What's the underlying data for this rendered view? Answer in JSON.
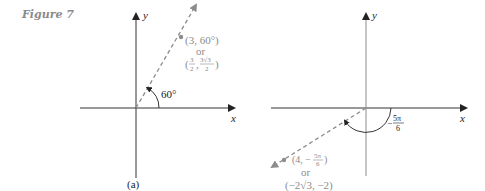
{
  "figure": {
    "title": "Figure 7",
    "colors": {
      "axis": "#333333",
      "dashed": "#8c8c8c",
      "gray_text": "#8c8c8c",
      "text": "#222222"
    },
    "panel_a": {
      "caption": "(a)",
      "x_axis_label": "x",
      "y_axis_label": "y",
      "angle_label": "60°",
      "point_polar": "(3, 60°)",
      "or_label": "or",
      "point_rect_open": "(",
      "point_rect_x_num": "3",
      "point_rect_x_den": "2",
      "point_rect_y_num": "3√3",
      "point_rect_y_den": "2",
      "point_rect_close": ")"
    },
    "panel_b": {
      "x_axis_label": "x",
      "y_axis_label": "y",
      "angle_label_sign": "−",
      "angle_label_num": "5π",
      "angle_label_den": "6",
      "point_polar_prefix": "(4, −",
      "point_polar_num": "5π",
      "point_polar_den": "6",
      "point_polar_suffix": ")",
      "or_label": "or",
      "point_rect": "(−2√3, −2)"
    }
  }
}
